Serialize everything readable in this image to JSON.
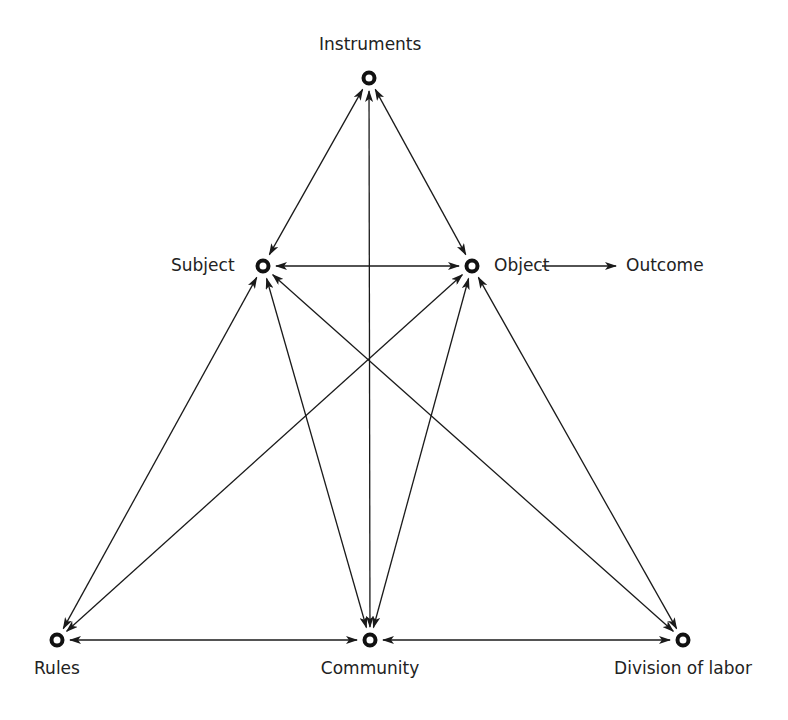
{
  "diagram": {
    "type": "activity-system-triangle",
    "top_clipped_caption": "",
    "nodes": [
      {
        "id": "instruments",
        "label": "Instruments",
        "x": 369,
        "y": 78,
        "label_pos": "above"
      },
      {
        "id": "subject",
        "label": "Subject",
        "x": 263,
        "y": 266,
        "label_pos": "left"
      },
      {
        "id": "object",
        "label": "Object",
        "x": 472,
        "y": 266,
        "label_pos": "right"
      },
      {
        "id": "rules",
        "label": "Rules",
        "x": 57,
        "y": 640,
        "label_pos": "below"
      },
      {
        "id": "community",
        "label": "Community",
        "x": 370,
        "y": 640,
        "label_pos": "below"
      },
      {
        "id": "division",
        "label": "Division of labor",
        "x": 683,
        "y": 640,
        "label_pos": "below"
      }
    ],
    "outcome": {
      "label": "Outcome",
      "from": "object"
    },
    "edges": [
      {
        "from": "instruments",
        "to": "subject",
        "bidirectional": true
      },
      {
        "from": "instruments",
        "to": "object",
        "bidirectional": true
      },
      {
        "from": "instruments",
        "to": "community",
        "bidirectional": true
      },
      {
        "from": "subject",
        "to": "object",
        "bidirectional": true
      },
      {
        "from": "subject",
        "to": "rules",
        "bidirectional": true
      },
      {
        "from": "subject",
        "to": "community",
        "bidirectional": true
      },
      {
        "from": "subject",
        "to": "division",
        "bidirectional": true
      },
      {
        "from": "object",
        "to": "rules",
        "bidirectional": true
      },
      {
        "from": "object",
        "to": "community",
        "bidirectional": true
      },
      {
        "from": "object",
        "to": "division",
        "bidirectional": true
      },
      {
        "from": "rules",
        "to": "community",
        "bidirectional": true
      },
      {
        "from": "community",
        "to": "division",
        "bidirectional": true
      },
      {
        "from": "object",
        "to": "outcome",
        "bidirectional": false
      }
    ]
  }
}
